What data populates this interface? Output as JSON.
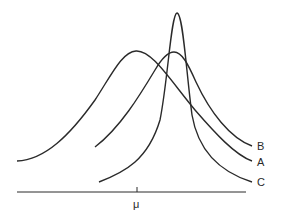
{
  "diagram": {
    "type": "distribution-curves",
    "axis": {
      "tick_label": "μ"
    },
    "curves": [
      {
        "id": "A",
        "label": "A",
        "description": "wide distribution, mode left of other curves"
      },
      {
        "id": "B",
        "label": "B",
        "description": "medium-width distribution, mode right of μ"
      },
      {
        "id": "C",
        "label": "C",
        "description": "narrow tall distribution, highest peak"
      }
    ],
    "colors": {
      "line": "#2a2a2a",
      "background": "#ffffff"
    }
  }
}
